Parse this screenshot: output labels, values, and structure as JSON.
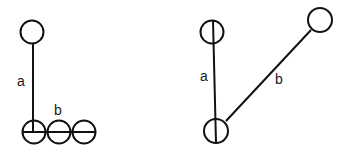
{
  "figure_left": {
    "label_a": "a",
    "label_b": "b"
  },
  "figure_right": {
    "label_a": "a",
    "label_b": "b"
  },
  "colors": {
    "stroke": "#111111",
    "background": "#ffffff"
  }
}
